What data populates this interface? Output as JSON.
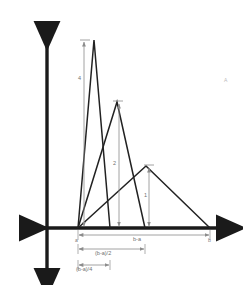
{
  "figure": {
    "title_mark": "A",
    "background": "#ffffff",
    "axis_color": "#1a1a1a",
    "curve_color": "#222222",
    "dimension_color": "#8c8c8c",
    "label_color": "#6f6f6f"
  },
  "axes": {
    "origin": {
      "x": 47,
      "y": 228
    },
    "x_axis": {
      "left_tip": 16,
      "right_tip": 226,
      "y": 228,
      "arrow_left": true,
      "arrow_right": true
    },
    "y_axis": {
      "top_tip": 17,
      "bottom_tip": 278,
      "x": 47,
      "arrow_up": true,
      "arrow_down": true
    }
  },
  "points": {
    "a_label": "a",
    "a_x": 78,
    "b_label": "b",
    "b_x": 210,
    "baseline_y": 228,
    "mid_x": 145,
    "quarter_x": 110
  },
  "triangles": [
    {
      "name": "tall-narrow-triangle",
      "left_x": 78,
      "apex_x": 94,
      "apex_y": 40,
      "right_x": 110,
      "height_label": "4"
    },
    {
      "name": "medium-triangle",
      "left_x": 78,
      "apex_x": 117,
      "apex_y": 102,
      "right_x": 145,
      "height_label": "2"
    },
    {
      "name": "wide-short-triangle",
      "left_x": 78,
      "apex_x": 146,
      "apex_y": 166,
      "right_x": 210,
      "height_label": "1"
    }
  ],
  "height_measures": [
    {
      "name": "height-measure-4",
      "label": "4",
      "x": 84,
      "top_y": 40,
      "bottom_y": 228,
      "label_x": 79,
      "label_y": 79
    },
    {
      "name": "height-measure-2",
      "label": "2",
      "x": 119,
      "top_y": 102,
      "bottom_y": 228,
      "label_x": 113,
      "label_y": 163
    },
    {
      "name": "height-measure-1",
      "label": "1",
      "x": 149,
      "top_y": 166,
      "bottom_y": 228,
      "label_x": 144,
      "label_y": 195
    }
  ],
  "span_measures": [
    {
      "name": "span-b-minus-a",
      "label": "b-a",
      "left_x": 78,
      "right_x": 210,
      "y": 235,
      "label_x": 136,
      "label_y": 238
    },
    {
      "name": "span-half",
      "label": "(b-a)/2",
      "left_x": 78,
      "right_x": 145,
      "y": 249,
      "label_x": 98,
      "label_y": 252
    },
    {
      "name": "span-quarter",
      "label": "(b-a)/4",
      "left_x": 78,
      "right_x": 110,
      "y": 265,
      "label_x": 78,
      "label_y": 268
    }
  ],
  "corner_mark": {
    "text": "A",
    "x": 225,
    "y": 80
  }
}
